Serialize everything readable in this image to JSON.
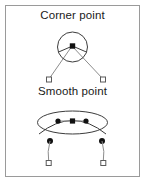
{
  "figure": {
    "background_color": "#ffffff",
    "frame_color": "#9a9a9a",
    "ink_color": "#3c3c3c",
    "handle_line_color": "#8c8c8c",
    "anchor_color": "#111111",
    "handle_fill": "#ffffff"
  },
  "panels": [
    {
      "id": "corner",
      "title": "Corner point",
      "shape": "circle",
      "description": "Circle with a corner anchor point at its apex and two independent direction handles",
      "anchor": {
        "type": "square",
        "x": 72,
        "y": 46
      },
      "direction_handles": [
        {
          "x": 49,
          "y": 80
        },
        {
          "x": 103,
          "y": 80
        }
      ]
    },
    {
      "id": "smooth",
      "title": "Smooth point",
      "shape": "ellipse",
      "description": "Ellipse with a smooth anchor point and two collinear direction handles",
      "anchor": {
        "type": "dot",
        "x": 72,
        "y": 121
      },
      "direction_points": [
        {
          "x": 58,
          "y": 121
        },
        {
          "x": 86,
          "y": 121
        }
      ],
      "direction_handles": [
        {
          "x": 50,
          "y": 163
        },
        {
          "x": 102,
          "y": 163
        }
      ],
      "curve_anchors": [
        {
          "x": 50,
          "y": 141
        },
        {
          "x": 102,
          "y": 141
        }
      ]
    }
  ]
}
